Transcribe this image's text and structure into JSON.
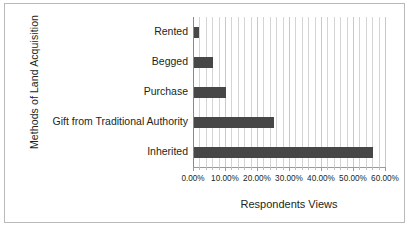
{
  "chart_data": {
    "type": "bar",
    "orientation": "horizontal",
    "title": "",
    "xlabel": "Respondents Views",
    "ylabel": "Methods of Land Acquisition",
    "categories": [
      "Inherited",
      "Gift from Traditional Authority",
      "Purchase",
      "Begged",
      "Rented"
    ],
    "values": [
      56.0,
      25.0,
      10.0,
      6.0,
      1.5
    ],
    "value_format": "percent",
    "xlim": [
      0,
      60
    ],
    "xticks": [
      0,
      10,
      20,
      30,
      40,
      50,
      60
    ],
    "xtick_labels": [
      "0.00%",
      "10.00%",
      "20.00%",
      "30.00%",
      "40.00%",
      "50.00%",
      "60.00%"
    ],
    "minor_tick_step": 2,
    "grid": "vertical-minor-and-major",
    "legend": "none",
    "bar_color": "#474747",
    "gridline_color": "#d4d4d4",
    "border_color": "#b9b9b9",
    "text_color": "#231f20"
  },
  "axes": {
    "y_title": "Methods of Land Acquisition",
    "x_title": "Respondents Views"
  }
}
